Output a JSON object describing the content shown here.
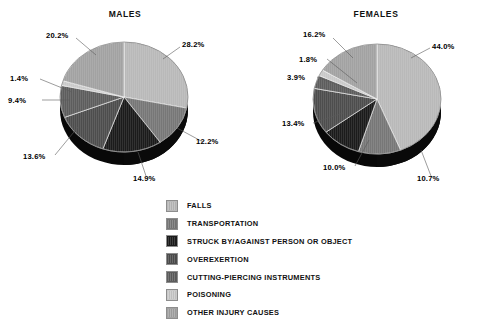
{
  "charts": [
    {
      "id": "males",
      "title": "MALES",
      "labels": [
        "28.2%",
        "12.2%",
        "14.9%",
        "13.6%",
        "9.4%",
        "1.4%",
        "20.2%"
      ]
    },
    {
      "id": "females",
      "title": "FEMALES",
      "labels": [
        "44.0%",
        "10.7%",
        "10.0%",
        "13.4%",
        "3.9%",
        "1.8%",
        "16.2%"
      ]
    }
  ],
  "legend": {
    "items": [
      {
        "label": "FALLS",
        "color": "#b9b9b9"
      },
      {
        "label": "TRANSPORTATION",
        "color": "#777777"
      },
      {
        "label": "STRUCK BY/AGAINST PERSON OR OBJECT",
        "color": "#1b1b1b"
      },
      {
        "label": "OVEREXERTION",
        "color": "#4d4d4d"
      },
      {
        "label": "CUTTING-PIERCING INSTRUMENTS",
        "color": "#5d5d5d"
      },
      {
        "label": "POISONING",
        "color": "#c9c9c9"
      },
      {
        "label": "OTHER INJURY CAUSES",
        "color": "#a2a2a2"
      }
    ]
  },
  "chart_data": [
    {
      "type": "pie",
      "title": "MALES",
      "categories": [
        "FALLS",
        "TRANSPORTATION",
        "STRUCK BY/AGAINST PERSON OR OBJECT",
        "OVEREXERTION",
        "CUTTING-PIERCING INSTRUMENTS",
        "POISONING",
        "OTHER INJURY CAUSES"
      ],
      "values": [
        28.2,
        12.2,
        14.9,
        13.6,
        9.4,
        1.4,
        20.2
      ],
      "value_labels": [
        "28.2%",
        "12.2%",
        "14.9%",
        "13.6%",
        "9.4%",
        "1.4%",
        "20.2%"
      ],
      "unit": "percent",
      "total": 99.9,
      "start_angle_deg": 0,
      "direction": "clockwise",
      "style": "3d-pie",
      "legend_position": "bottom-center"
    },
    {
      "type": "pie",
      "title": "FEMALES",
      "categories": [
        "FALLS",
        "TRANSPORTATION",
        "STRUCK BY/AGAINST PERSON OR OBJECT",
        "OVEREXERTION",
        "CUTTING-PIERCING INSTRUMENTS",
        "POISONING",
        "OTHER INJURY CAUSES"
      ],
      "values": [
        44.0,
        10.7,
        10.0,
        13.4,
        3.9,
        1.8,
        16.2
      ],
      "value_labels": [
        "44.0%",
        "10.7%",
        "10.0%",
        "13.4%",
        "3.9%",
        "1.8%",
        "16.2%"
      ],
      "unit": "percent",
      "total": 100.0,
      "start_angle_deg": 0,
      "direction": "clockwise",
      "style": "3d-pie",
      "legend_position": "bottom-center"
    }
  ]
}
